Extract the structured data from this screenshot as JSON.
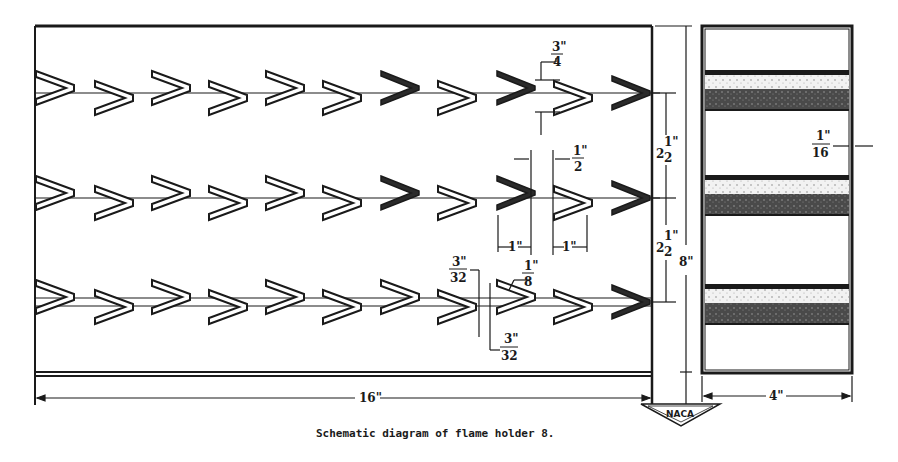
{
  "figure": {
    "caption": "Schematic diagram of flame holder 8.",
    "logo_text": "NACA",
    "ink_color": "#1a1a1a",
    "band_fill": "#555555",
    "band_light": "#e6e6e6"
  },
  "front_view": {
    "width_label": "16\"",
    "rows": [
      {
        "name": "row-1",
        "y": 93,
        "style": "single-rod"
      },
      {
        "name": "row-2",
        "y": 198,
        "style": "single-rod"
      },
      {
        "name": "row-3",
        "y": 302,
        "style": "double-rod"
      }
    ],
    "chevron_x": [
      36,
      95,
      152,
      209,
      266,
      323,
      381,
      438,
      497,
      554,
      612
    ],
    "dimensions": {
      "row1_gap": {
        "num": "3\"",
        "den": "4"
      },
      "row2_half": {
        "num": "1\"",
        "den": "2"
      },
      "row2_chevron_a": "1\"",
      "row2_chevron_b": "1\"",
      "row3_rod_top": {
        "num": "3\"",
        "den": "32"
      },
      "row3_strip": {
        "num": "1\"",
        "den": "8"
      },
      "row3_rod_bottom": {
        "num": "3\"",
        "den": "32"
      }
    }
  },
  "height_dims": {
    "spacing_upper": {
      "whole": "2",
      "num": "1\"",
      "den": "2"
    },
    "spacing_lower": {
      "whole": "2",
      "num": "1\"",
      "den": "2"
    },
    "total_height": "8\""
  },
  "side_view": {
    "width_label": "4\"",
    "thickness": {
      "num": "1\"",
      "den": "16"
    },
    "bands_y": [
      70,
      175,
      283
    ]
  }
}
